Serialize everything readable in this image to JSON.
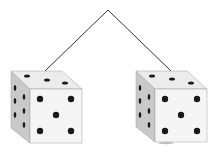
{
  "scene": {
    "description": "Two hanging dice connected by a string",
    "colors": {
      "background": "#ffffff",
      "string": "#333333",
      "top_face": "#efefef",
      "front_face": "#f4f4f4",
      "side_face": "#c9c9c9",
      "pip": "#1a1a1a",
      "edge": "#9a9a9a"
    },
    "dice": [
      {
        "name": "left-die",
        "top_pips": 3,
        "front_pips": 5,
        "side_pips": 6
      },
      {
        "name": "right-die",
        "top_pips": 3,
        "front_pips": 5,
        "side_pips": 6
      }
    ]
  }
}
